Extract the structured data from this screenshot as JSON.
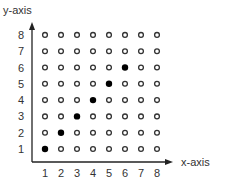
{
  "chart_data": {
    "type": "scatter",
    "title": "",
    "xlabel": "x-axis",
    "ylabel": "y-axis",
    "x_ticks": [
      1,
      2,
      3,
      4,
      5,
      6,
      7,
      8
    ],
    "y_ticks": [
      1,
      2,
      3,
      4,
      5,
      6,
      7,
      8
    ],
    "xlim": [
      1,
      8
    ],
    "ylim": [
      1,
      8
    ],
    "grid": false,
    "legend": null,
    "series": [
      {
        "name": "filled",
        "marker": "filled-circle",
        "color": "#000000",
        "points": [
          [
            1,
            1
          ],
          [
            2,
            2
          ],
          [
            3,
            3
          ],
          [
            4,
            4
          ],
          [
            5,
            5
          ],
          [
            6,
            6
          ]
        ]
      },
      {
        "name": "open",
        "marker": "open-circle",
        "color": "#333333",
        "points": "all other grid points (x in 1..8, y in 1..8)"
      }
    ]
  },
  "labels": {
    "x_axis": "x-axis",
    "y_axis": "y-axis"
  }
}
